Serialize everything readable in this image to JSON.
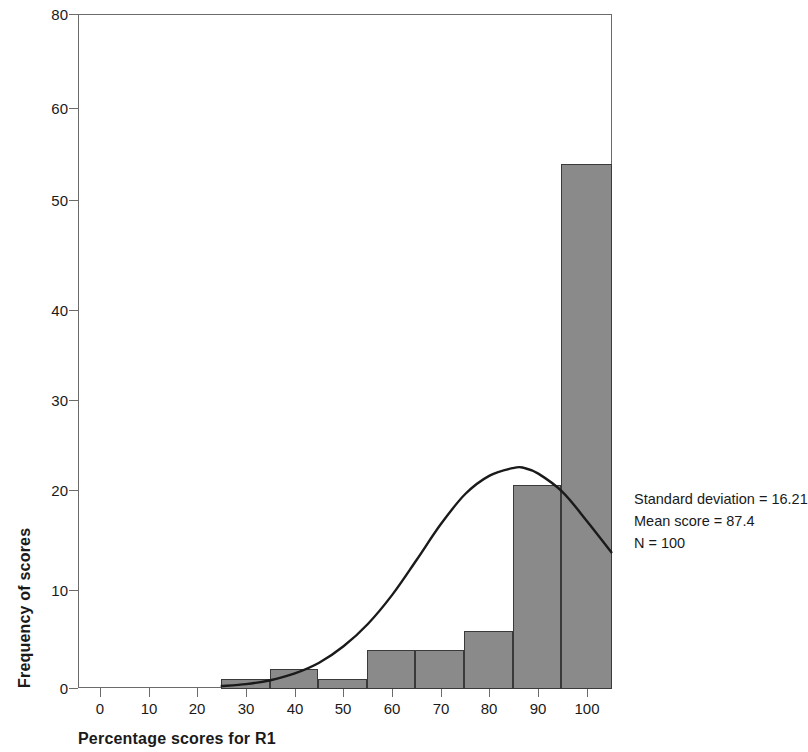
{
  "chart_data": {
    "type": "bar",
    "title": "",
    "xlabel": "Percentage scores for R1",
    "ylabel": "Frequency of scores",
    "xlim": [
      0,
      105
    ],
    "ylim": [
      0,
      80
    ],
    "grid": false,
    "legend": null,
    "bin_width": 10,
    "categories": [
      "25-35",
      "35-45",
      "45-55",
      "55-65",
      "65-75",
      "75-85",
      "85-95",
      "95-105"
    ],
    "bin_edges": [
      25,
      35,
      45,
      55,
      65,
      75,
      85,
      95,
      105
    ],
    "values": [
      1,
      2,
      1,
      4,
      4,
      6,
      21,
      54
    ],
    "x_tick_labels": [
      "0",
      "10",
      "20",
      "30",
      "40",
      "50",
      "60",
      "70",
      "80",
      "90",
      "100"
    ],
    "x_tick_values": [
      0,
      10,
      20,
      30,
      40,
      50,
      60,
      70,
      80,
      90,
      100
    ],
    "y_tick_labels": [
      "0",
      "10",
      "20",
      "30",
      "40",
      "50",
      "60",
      "80"
    ],
    "y_tick_positions": [
      0,
      10,
      20,
      30,
      40,
      50,
      60,
      70
    ],
    "overlay": {
      "type": "line",
      "name": "normal curve",
      "peak_value": 22.7,
      "peak_x": 87,
      "end_value": 14,
      "points": [
        [
          25,
          0.2
        ],
        [
          30,
          0.4
        ],
        [
          35,
          0.8
        ],
        [
          40,
          1.5
        ],
        [
          45,
          2.6
        ],
        [
          50,
          4.3
        ],
        [
          55,
          6.6
        ],
        [
          60,
          9.6
        ],
        [
          65,
          13.2
        ],
        [
          70,
          16.9
        ],
        [
          75,
          20.0
        ],
        [
          80,
          21.9
        ],
        [
          85,
          22.7
        ],
        [
          87,
          22.7
        ],
        [
          90,
          22.1
        ],
        [
          95,
          20.2
        ],
        [
          100,
          17.2
        ],
        [
          105,
          14.0
        ]
      ]
    },
    "annotations": [
      "Standard deviation = 16.21",
      "Mean score = 87.4",
      "N = 100"
    ],
    "colors": {
      "bar_fill": "#8a8a8a",
      "bar_edge": "#3a3a3a",
      "curve": "#1a1a1a",
      "axis": "#6b6b6b",
      "text": "#1a1a1a",
      "background": "#ffffff"
    }
  },
  "stats": {
    "standard_deviation": "Standard deviation = 16.21",
    "mean_score": "Mean score = 87.4",
    "n": "N = 100"
  }
}
